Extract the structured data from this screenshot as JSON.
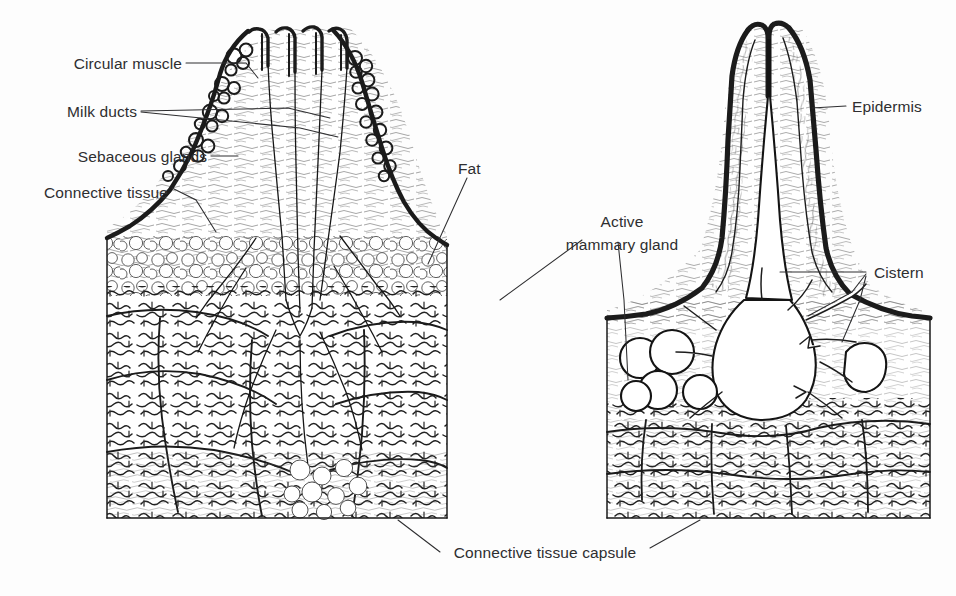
{
  "figure": {
    "background_color": "#fdfdfd",
    "ink_color": "#1b1b1b",
    "label_color": "#2e2e30",
    "panels": [
      {
        "id": "left-panel",
        "name": "non-lactating teat and mammary gland cross-section"
      },
      {
        "id": "right-panel",
        "name": "lactating teat with gland cistern cross-section"
      }
    ]
  },
  "labels": {
    "circular_muscle": "Circular muscle",
    "milk_ducts": "Milk ducts",
    "sebaceous_glands": "Sebaceous glands",
    "connective_tissue": "Connective tissue",
    "fat": "Fat",
    "active_mammary_gland_line1": "Active",
    "active_mammary_gland_line2": "mammary gland",
    "epidermis": "Epidermis",
    "cistern": "Cistern",
    "connective_tissue_capsule": "Connective tissue capsule"
  }
}
